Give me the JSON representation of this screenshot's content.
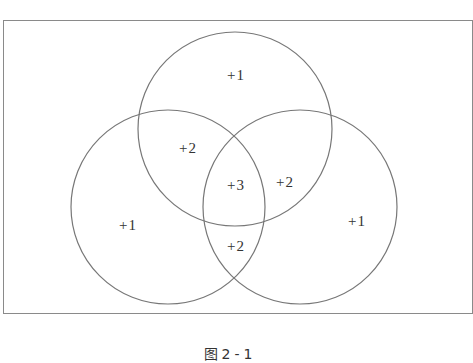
{
  "diagram": {
    "type": "venn-3",
    "stroke_color": "#777777",
    "frame_color": "#8a8a8a",
    "circles": [
      {
        "name": "top",
        "cx": 235,
        "cy": 129,
        "r": 97
      },
      {
        "name": "left",
        "cx": 168,
        "cy": 207,
        "r": 97
      },
      {
        "name": "right",
        "cx": 300,
        "cy": 207,
        "r": 97
      }
    ],
    "regions": [
      {
        "name": "top-only",
        "label": "+1",
        "x": 236,
        "y": 75
      },
      {
        "name": "top-left",
        "label": "+2",
        "x": 188,
        "y": 148
      },
      {
        "name": "center",
        "label": "+3",
        "x": 236,
        "y": 185
      },
      {
        "name": "top-right",
        "label": "+2",
        "x": 285,
        "y": 182
      },
      {
        "name": "left-only",
        "label": "+1",
        "x": 128,
        "y": 225
      },
      {
        "name": "right-only",
        "label": "+1",
        "x": 357,
        "y": 221
      },
      {
        "name": "left-right",
        "label": "+2",
        "x": 236,
        "y": 246
      }
    ]
  },
  "caption": "图2-1"
}
